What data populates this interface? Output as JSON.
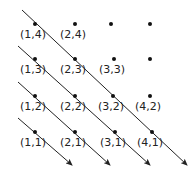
{
  "diagram": {
    "title": "",
    "points": [
      {
        "label": "(1,4)",
        "x": 35,
        "y": 24
      },
      {
        "label": "(2,4)",
        "x": 75,
        "y": 24
      },
      {
        "label": "",
        "x": 111,
        "y": 24
      },
      {
        "label": "",
        "x": 150,
        "y": 24
      },
      {
        "label": "(1,3)",
        "x": 35,
        "y": 59
      },
      {
        "label": "(2,3)",
        "x": 75,
        "y": 59
      },
      {
        "label": "(3,3)",
        "x": 114,
        "y": 59
      },
      {
        "label": "",
        "x": 150,
        "y": 59
      },
      {
        "label": "(1,2)",
        "x": 35,
        "y": 96
      },
      {
        "label": "(2,2)",
        "x": 75,
        "y": 96
      },
      {
        "label": "(3,2)",
        "x": 113,
        "y": 96
      },
      {
        "label": "(4,2)",
        "x": 150,
        "y": 96
      },
      {
        "label": "(1,1)",
        "x": 35,
        "y": 132
      },
      {
        "label": "(2,1)",
        "x": 75,
        "y": 132
      },
      {
        "label": "(3,1)",
        "x": 115,
        "y": 132
      },
      {
        "label": "(4,1)",
        "x": 152,
        "y": 132
      }
    ],
    "arrows": [
      {
        "from": [
          18,
          118
        ],
        "to": [
          72,
          165
        ],
        "passes": [
          "(1,1)"
        ]
      },
      {
        "from": [
          18,
          82
        ],
        "to": [
          110,
          165
        ],
        "passes": [
          "(1,2)",
          "(2,1)"
        ]
      },
      {
        "from": [
          18,
          46
        ],
        "to": [
          150,
          165
        ],
        "passes": [
          "(1,3)",
          "(2,2)",
          "(3,1)"
        ]
      },
      {
        "from": [
          22,
          10
        ],
        "to": [
          187,
          165
        ],
        "passes": [
          "(1,4)",
          "(2,3)",
          "(3,2)",
          "(4,1)"
        ]
      }
    ],
    "label_offset": {
      "dx": -2,
      "dy": 14
    }
  }
}
